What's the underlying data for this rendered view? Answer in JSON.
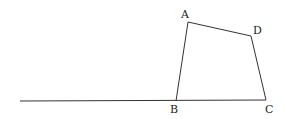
{
  "diagram": {
    "type": "geometry",
    "stroke_color": "#333333",
    "baseline": {
      "x1": 20,
      "y1": 101,
      "x2": 266,
      "y2": 100
    },
    "points": {
      "A": {
        "label": "A",
        "x": 188,
        "y": 22
      },
      "B": {
        "label": "B",
        "x": 176,
        "y": 101
      },
      "C": {
        "label": "C",
        "x": 266,
        "y": 100
      },
      "D": {
        "label": "D",
        "x": 251,
        "y": 36
      }
    },
    "segments": [
      [
        "A",
        "B"
      ],
      [
        "A",
        "D"
      ],
      [
        "D",
        "C"
      ],
      [
        "B",
        "C"
      ]
    ]
  }
}
